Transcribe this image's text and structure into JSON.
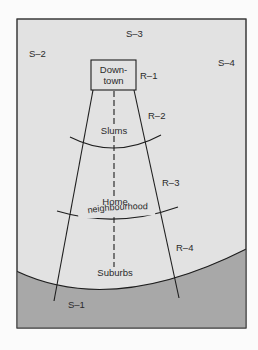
{
  "diagram": {
    "type": "urban-zones-and-paths",
    "colors": {
      "page_background": "#fbfbfb",
      "frame_fill": "#e2e2e2",
      "lower_zone_fill": "#a8a8a8",
      "line": "#1e1e1e"
    },
    "districts": {
      "downtown": {
        "line1": "Down-",
        "line2": "town"
      },
      "slums": "Slums",
      "home": {
        "line1": "Home",
        "line2": "neighbourhood"
      },
      "suburbs": "Suburbs"
    },
    "ring_labels": {
      "r1": "R–1",
      "r2": "R–2",
      "r3": "R–3",
      "r4": "R–4"
    },
    "sector_labels": {
      "s1": "S–1",
      "s2": "S–2",
      "s3": "S–3",
      "s4": "S–4"
    }
  }
}
